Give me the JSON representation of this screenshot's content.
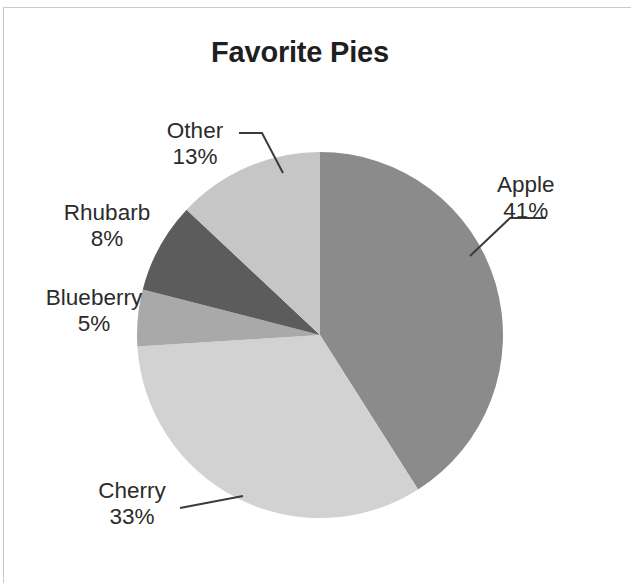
{
  "chart_data": {
    "type": "pie",
    "title": "Favorite Pies",
    "categories": [
      "Apple",
      "Cherry",
      "Blueberry",
      "Rhubarb",
      "Other"
    ],
    "values": [
      41,
      33,
      5,
      8,
      13
    ],
    "value_unit": "%",
    "labels": [
      "41%",
      "33%",
      "5%",
      "8%",
      "13%"
    ],
    "colors": [
      "#8b8b8b",
      "#d2d2d2",
      "#a9a9a9",
      "#5c5c5c",
      "#c6c6c6"
    ],
    "start_angle_deg": 0,
    "direction": "clockwise",
    "legend": "none",
    "labels_position": "outside-with-leader-lines",
    "grid": false,
    "xlabel": "",
    "ylabel": ""
  },
  "title": "Favorite Pies",
  "slices": [
    {
      "name": "Apple",
      "value": "41%"
    },
    {
      "name": "Cherry",
      "value": "33%"
    },
    {
      "name": "Blueberry",
      "value": "5%"
    },
    {
      "name": "Rhubarb",
      "value": "8%"
    },
    {
      "name": "Other",
      "value": "13%"
    }
  ]
}
